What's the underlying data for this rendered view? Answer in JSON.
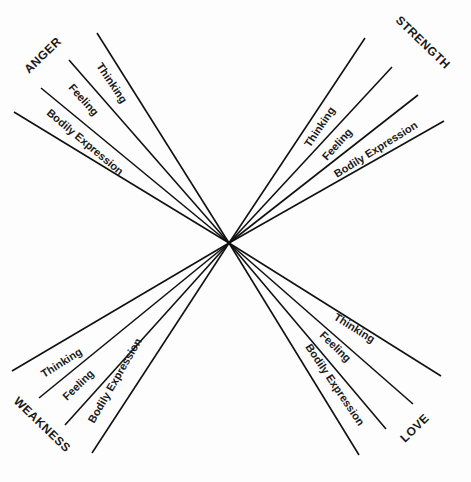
{
  "diagram": {
    "center": [
      229,
      243
    ],
    "groups": [
      {
        "name": "ANGER",
        "lines": [
          [
            97,
            33
          ],
          [
            69,
            60
          ],
          [
            41,
            88
          ],
          [
            14,
            112
          ]
        ],
        "labels": [
          "Thinking",
          "Feeling",
          "Bodily Expression"
        ]
      },
      {
        "name": "STRENGTH",
        "lines": [
          [
            365,
            38
          ],
          [
            392,
            67
          ],
          [
            418,
            95
          ],
          [
            444,
            121
          ]
        ],
        "labels": [
          "Thinking",
          "Feeling",
          "Bodily Expression"
        ]
      },
      {
        "name": "WEAKNESS",
        "lines": [
          [
            12,
            371
          ],
          [
            39,
            398
          ],
          [
            65,
            425
          ],
          [
            92,
            453
          ]
        ],
        "labels": [
          "Thinking",
          "Feeling",
          "Bodily Expression"
        ]
      },
      {
        "name": "LOVE",
        "lines": [
          [
            441,
            376
          ],
          [
            413,
            404
          ],
          [
            386,
            429
          ],
          [
            359,
            455
          ]
        ],
        "labels": [
          "Thinking",
          "Feeling",
          "Bodily Expression"
        ]
      }
    ]
  },
  "text": {
    "anger": "ANGER",
    "strength": "STRENGTH",
    "weakness": "WEAKNESS",
    "love": "LOVE",
    "thinking": "Thinking",
    "feeling": "Feeling",
    "bodily": "Bodily Expression"
  }
}
